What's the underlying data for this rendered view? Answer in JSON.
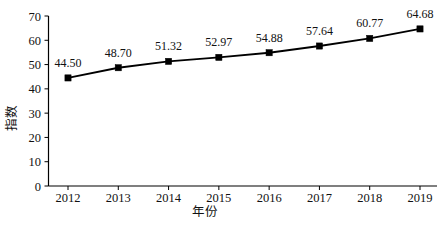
{
  "chart_data": {
    "type": "line",
    "title": "",
    "subtitle": "",
    "xlabel": "年份",
    "ylabel": "指数",
    "categories": [
      "2012",
      "2013",
      "2014",
      "2015",
      "2016",
      "2017",
      "2018",
      "2019"
    ],
    "x": [
      2012,
      2013,
      2014,
      2015,
      2016,
      2017,
      2018,
      2019
    ],
    "values": [
      44.5,
      48.7,
      51.32,
      52.97,
      54.88,
      57.64,
      60.77,
      64.68
    ],
    "point_labels": [
      "44.50",
      "48.70",
      "51.32",
      "52.97",
      "54.88",
      "57.64",
      "60.77",
      "64.68"
    ],
    "series": [
      {
        "name": "指数",
        "values": [
          44.5,
          48.7,
          51.32,
          52.97,
          54.88,
          57.64,
          60.77,
          64.68
        ],
        "color": "#000000",
        "marker": "filled-square"
      }
    ],
    "ylim": [
      0,
      70
    ],
    "ytick_step": 10,
    "ytick_labels": [
      "0",
      "10",
      "20",
      "30",
      "40",
      "50",
      "60",
      "70"
    ],
    "ytick_values": [
      0,
      10,
      20,
      30,
      40,
      50,
      60,
      70
    ],
    "xtick_labels": [
      "2012",
      "2013",
      "2014",
      "2015",
      "2016",
      "2017",
      "2018",
      "2019"
    ],
    "grid": false,
    "legend": false,
    "legend_position": "none",
    "background_color": "#ffffff",
    "line_color": "#000000",
    "marker_color": "#000000",
    "annotations": []
  }
}
